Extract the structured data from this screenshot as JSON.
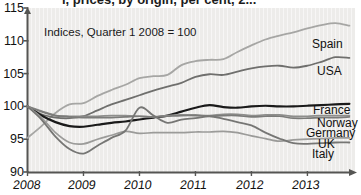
{
  "title": {
    "text_partial": "l, prices, by origin, per cent, 2...",
    "visible": "clipped"
  },
  "annotation": {
    "text": "Indices, Quarter 1 2008 = 100"
  },
  "axes": {
    "y_ticks": [
      "115",
      "110",
      "105",
      "100",
      "95",
      "90"
    ],
    "x_ticks": [
      "2008",
      "2009",
      "2010",
      "2011",
      "2012",
      "2013"
    ],
    "y_label": "",
    "x_label": ""
  },
  "chart_data": {
    "type": "line",
    "title": "Indices, Quarter 1 2008 = 100",
    "xlabel": "",
    "ylabel": "Index (Q1 2008 = 100)",
    "xlim": [
      2008.0,
      2013.85
    ],
    "ylim": [
      90,
      115
    ],
    "grid": false,
    "legend_position": "right-inline-labels",
    "x": [
      2008.0,
      2008.25,
      2008.5,
      2008.75,
      2009.0,
      2009.25,
      2009.5,
      2009.75,
      2010.0,
      2010.25,
      2010.5,
      2010.75,
      2011.0,
      2011.25,
      2011.5,
      2011.75,
      2012.0,
      2012.25,
      2012.5,
      2012.75,
      2013.0,
      2013.25,
      2013.5,
      2013.75
    ],
    "series": [
      {
        "name": "Spain",
        "color": "#a6a6a4",
        "width": 1.8,
        "values": [
          95.2,
          97.0,
          99.0,
          100.3,
          100.5,
          101.6,
          102.5,
          103.3,
          104.3,
          104.6,
          104.8,
          106.3,
          106.9,
          107.1,
          107.2,
          108.3,
          109.3,
          110.2,
          110.8,
          111.3,
          111.9,
          112.4,
          112.7,
          112.3
        ]
      },
      {
        "name": "USA",
        "color": "#6f6f6d",
        "width": 1.8,
        "values": [
          100.0,
          98.8,
          98.3,
          98.2,
          98.5,
          99.4,
          100.3,
          101.0,
          101.7,
          102.4,
          103.0,
          103.6,
          104.5,
          104.9,
          104.8,
          105.3,
          105.8,
          106.1,
          106.2,
          105.9,
          106.2,
          106.8,
          107.5,
          107.4
        ]
      },
      {
        "name": "France",
        "color": "#1a1a1a",
        "width": 2.2,
        "values": [
          100.0,
          98.6,
          97.6,
          97.0,
          96.9,
          97.2,
          97.5,
          97.7,
          98.0,
          98.3,
          98.6,
          99.2,
          99.8,
          100.2,
          99.9,
          99.8,
          100.0,
          100.1,
          100.0,
          100.0,
          100.1,
          100.2,
          100.3,
          100.4
        ]
      },
      {
        "name": "Norway",
        "color": "#8e8e8c",
        "width": 1.7,
        "values": [
          100.0,
          99.3,
          98.6,
          98.5,
          98.5,
          98.5,
          98.6,
          98.6,
          98.5,
          98.4,
          98.6,
          98.7,
          98.7,
          98.6,
          98.8,
          98.8,
          98.6,
          98.7,
          98.7,
          98.5,
          98.5,
          98.6,
          98.6,
          98.6
        ]
      },
      {
        "name": "Germany",
        "color": "#7b7b79",
        "width": 1.7,
        "values": [
          100.0,
          99.2,
          98.6,
          98.4,
          98.3,
          98.3,
          98.3,
          98.4,
          98.5,
          98.4,
          98.5,
          98.6,
          98.6,
          98.5,
          98.6,
          98.6,
          98.4,
          98.5,
          98.5,
          98.2,
          98.2,
          98.3,
          98.3,
          98.4
        ]
      },
      {
        "name": "UK",
        "color": "#9b9b99",
        "width": 1.7,
        "values": [
          100.0,
          98.3,
          96.0,
          94.5,
          94.3,
          95.0,
          95.6,
          96.2,
          95.9,
          96.0,
          96.0,
          96.0,
          96.1,
          96.1,
          96.2,
          96.0,
          95.5,
          95.1,
          94.7,
          94.9,
          95.0,
          95.1,
          95.2,
          95.2
        ]
      },
      {
        "name": "Italy",
        "color": "#767674",
        "width": 1.8,
        "values": [
          100.0,
          98.0,
          95.4,
          93.5,
          92.8,
          94.0,
          95.2,
          96.3,
          99.8,
          98.6,
          97.5,
          98.0,
          98.2,
          98.5,
          98.1,
          97.6,
          97.1,
          96.0,
          95.1,
          94.4,
          94.3,
          94.4,
          94.5,
          94.5
        ]
      }
    ]
  },
  "series_labels": [
    {
      "name": "Spain",
      "x": 312,
      "y": 38
    },
    {
      "name": "USA",
      "x": 317,
      "y": 65
    },
    {
      "name": "France",
      "x": 313,
      "y": 104
    },
    {
      "name": "Norway",
      "x": 317,
      "y": 117
    },
    {
      "name": "Germany",
      "x": 306,
      "y": 127
    },
    {
      "name": "UK",
      "x": 318,
      "y": 138
    },
    {
      "name": "Italy",
      "x": 312,
      "y": 148
    }
  ]
}
